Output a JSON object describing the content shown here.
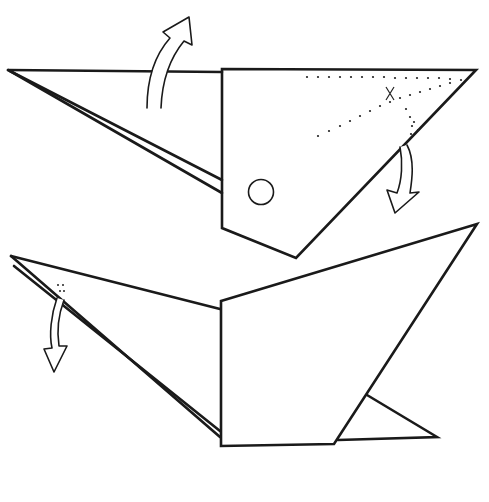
{
  "diagram": {
    "type": "origami-fold-instructions",
    "steps": [
      {
        "id": "step-1",
        "description": "Head of bird with long beak shape; fold top flap of beak up (valley-up arrow), fold head corner along dotted lines down; eye circle marked; x marks fold point",
        "marks": {
          "x_label": "X",
          "eye": "circle"
        },
        "arrows": [
          "fold-up-arrow",
          "fold-down-arrow"
        ]
      },
      {
        "id": "step-2",
        "description": "Resulting shape with tail triangle at bottom right; fold beak tip down",
        "arrows": [
          "fold-down-arrow"
        ]
      }
    ],
    "colors": {
      "line": "#1a1a1a",
      "background": "#ffffff"
    }
  }
}
